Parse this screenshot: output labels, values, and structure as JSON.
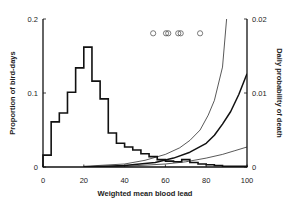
{
  "chart_data": {
    "type": "bar+line",
    "title": "",
    "xlabel": "Weighted mean blood lead",
    "ylabel_left": "Proportion of bird-days",
    "ylabel_right": "Daily probability of death",
    "xlim": [
      0,
      100
    ],
    "ylim_left": [
      0,
      0.2
    ],
    "ylim_right": [
      0,
      0.02
    ],
    "x_ticks": [
      0,
      20,
      40,
      60,
      80,
      100
    ],
    "y_ticks_left": [
      0,
      0.1,
      0.2
    ],
    "y_ticks_left_labels": [
      "0",
      "0.1",
      "0.2"
    ],
    "y_ticks_right": [
      0,
      0.01,
      0.02
    ],
    "y_ticks_right_labels": [
      "0",
      "0.01",
      "0.02"
    ],
    "grid": false,
    "legend": null,
    "histogram": {
      "name": "Proportion of bird-days",
      "axis": "left",
      "bin_width": 4,
      "bin_starts": [
        0,
        4,
        8,
        12,
        16,
        20,
        24,
        28,
        32,
        36,
        40,
        44,
        48,
        52,
        56,
        60,
        64,
        68,
        72,
        76,
        80,
        84,
        88,
        92,
        96
      ],
      "values": [
        0.016,
        0.061,
        0.073,
        0.101,
        0.134,
        0.162,
        0.116,
        0.092,
        0.046,
        0.032,
        0.027,
        0.023,
        0.018,
        0.014,
        0.01,
        0.008,
        0.007,
        0.01,
        0.006,
        0.004,
        0.003,
        0.002,
        0.001,
        0.001,
        0.001
      ]
    },
    "series": [
      {
        "name": "mortality curve (steep, thin)",
        "axis": "right",
        "style": "thin",
        "x": [
          20,
          40,
          50,
          60,
          67,
          72,
          77,
          81,
          84,
          88,
          90
        ],
        "values": [
          0.0001,
          0.0004,
          0.0009,
          0.0017,
          0.0026,
          0.0036,
          0.005,
          0.007,
          0.009,
          0.0135,
          0.02
        ]
      },
      {
        "name": "mortality curve (medium, thick)",
        "axis": "right",
        "style": "thick",
        "x": [
          20,
          40,
          55,
          64,
          72,
          80,
          84,
          88,
          92,
          96,
          100
        ],
        "values": [
          0.0,
          0.0002,
          0.0006,
          0.0012,
          0.002,
          0.0032,
          0.0043,
          0.0058,
          0.0075,
          0.0098,
          0.0126
        ]
      },
      {
        "name": "mortality curve (shallow, thin)",
        "axis": "right",
        "style": "thin",
        "x": [
          20,
          40,
          60,
          70,
          80,
          88,
          94,
          100
        ],
        "values": [
          0.0,
          0.0001,
          0.0004,
          0.0007,
          0.0012,
          0.0017,
          0.0022,
          0.0027
        ]
      }
    ],
    "points": {
      "name": "open circles",
      "axis": "right",
      "marker": "open-circle",
      "x": [
        54,
        60.3,
        61.4,
        66.3,
        67.5,
        77
      ],
      "values": [
        0.018,
        0.018,
        0.018,
        0.018,
        0.018,
        0.018
      ]
    }
  }
}
